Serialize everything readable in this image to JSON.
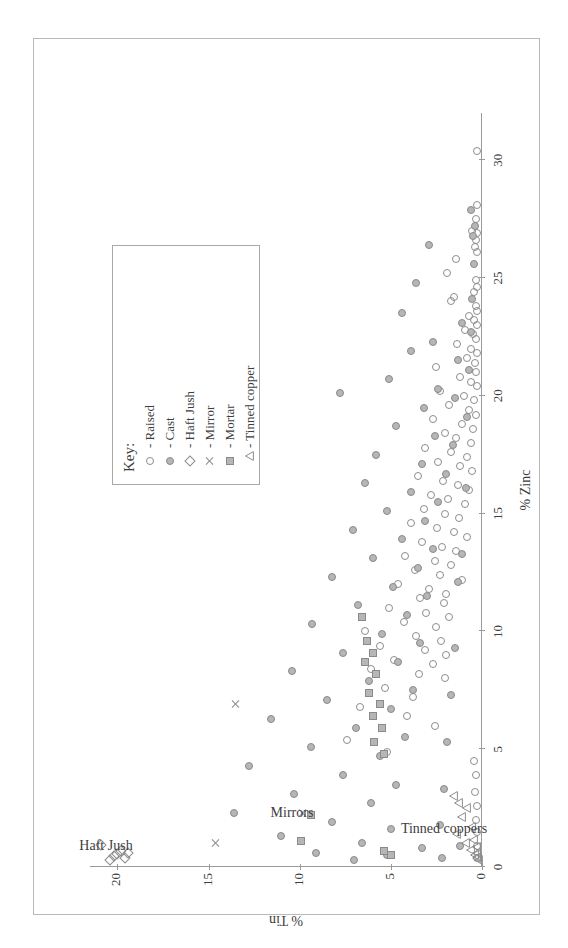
{
  "chart_data": {
    "type": "scatter",
    "title": "",
    "xlabel": "% Zinc",
    "ylabel": "% Tin",
    "xlim": [
      0,
      32
    ],
    "ylim": [
      0,
      21.5
    ],
    "xticks": [
      0,
      5,
      10,
      15,
      20,
      25,
      30
    ],
    "yticks": [
      0,
      5,
      10,
      15,
      20
    ],
    "xtick_labels": [
      "0",
      "5",
      "10",
      "15",
      "20",
      "25",
      "30"
    ],
    "ytick_labels": [
      "0",
      "5",
      "10",
      "15",
      "20"
    ],
    "grid": false,
    "legend_position": "top-right",
    "orientation": "rotated-90-ccw",
    "annotations": [
      {
        "text": "Haft Jush",
        "x": 0.9,
        "y": 20.6
      },
      {
        "text": "Mirrors",
        "x": 2.3,
        "y": 10.4
      },
      {
        "text": "Tinned coppers",
        "x": 1.6,
        "y": 2.1
      }
    ],
    "series": [
      {
        "name": "Raised",
        "marker": "open-circle",
        "color": "#8d8d8d",
        "fill": "none",
        "points": [
          [
            30.4,
            0.3
          ],
          [
            28.1,
            0.25
          ],
          [
            27.5,
            0.35
          ],
          [
            27.0,
            0.55
          ],
          [
            26.9,
            0.3
          ],
          [
            26.6,
            0.35
          ],
          [
            26.3,
            0.4
          ],
          [
            26.1,
            0.3
          ],
          [
            25.8,
            1.4
          ],
          [
            25.2,
            1.9
          ],
          [
            24.9,
            0.35
          ],
          [
            24.6,
            0.3
          ],
          [
            24.4,
            0.45
          ],
          [
            24.2,
            1.55
          ],
          [
            24.0,
            1.7
          ],
          [
            23.8,
            0.35
          ],
          [
            23.6,
            0.3
          ],
          [
            23.4,
            0.7
          ],
          [
            23.2,
            0.45
          ],
          [
            23.0,
            0.3
          ],
          [
            22.8,
            0.95
          ],
          [
            22.6,
            0.5
          ],
          [
            22.4,
            0.35
          ],
          [
            22.2,
            1.35
          ],
          [
            22.0,
            0.6
          ],
          [
            21.8,
            0.3
          ],
          [
            21.6,
            0.85
          ],
          [
            21.4,
            0.4
          ],
          [
            21.2,
            2.5
          ],
          [
            21.0,
            0.35
          ],
          [
            20.8,
            1.2
          ],
          [
            20.6,
            0.6
          ],
          [
            20.4,
            0.3
          ],
          [
            20.2,
            2.3
          ],
          [
            20.0,
            1.0
          ],
          [
            19.8,
            0.45
          ],
          [
            19.6,
            1.8
          ],
          [
            19.4,
            0.7
          ],
          [
            19.2,
            0.35
          ],
          [
            19.0,
            2.7
          ],
          [
            18.8,
            1.1
          ],
          [
            18.6,
            0.5
          ],
          [
            18.4,
            2.05
          ],
          [
            18.2,
            1.45
          ],
          [
            18.0,
            0.6
          ],
          [
            17.8,
            3.1
          ],
          [
            17.6,
            1.7
          ],
          [
            17.4,
            0.8
          ],
          [
            17.2,
            2.4
          ],
          [
            17.0,
            1.2
          ],
          [
            16.8,
            0.55
          ],
          [
            16.6,
            3.5
          ],
          [
            16.4,
            2.15
          ],
          [
            16.2,
            1.3
          ],
          [
            16.0,
            0.7
          ],
          [
            15.8,
            2.8
          ],
          [
            15.6,
            1.85
          ],
          [
            15.4,
            0.95
          ],
          [
            15.2,
            3.2
          ],
          [
            15.0,
            2.05
          ],
          [
            14.8,
            1.25
          ],
          [
            14.6,
            3.9
          ],
          [
            14.4,
            2.45
          ],
          [
            14.2,
            1.55
          ],
          [
            14.0,
            0.85
          ],
          [
            13.8,
            3.3
          ],
          [
            13.6,
            2.2
          ],
          [
            13.4,
            1.4
          ],
          [
            13.2,
            4.2
          ],
          [
            13.0,
            2.6
          ],
          [
            12.8,
            1.7
          ],
          [
            12.6,
            3.7
          ],
          [
            12.4,
            2.3
          ],
          [
            12.2,
            1.1
          ],
          [
            12.0,
            4.6
          ],
          [
            11.8,
            2.9
          ],
          [
            11.6,
            1.95
          ],
          [
            11.4,
            3.4
          ],
          [
            11.2,
            2.1
          ],
          [
            11.0,
            5.1
          ],
          [
            10.8,
            3.05
          ],
          [
            10.6,
            1.8
          ],
          [
            10.4,
            4.3
          ],
          [
            10.2,
            2.55
          ],
          [
            10.0,
            6.4
          ],
          [
            9.8,
            3.6
          ],
          [
            9.6,
            2.25
          ],
          [
            9.4,
            5.6
          ],
          [
            9.2,
            3.15
          ],
          [
            9.0,
            1.95
          ],
          [
            8.8,
            4.8
          ],
          [
            8.6,
            2.7
          ],
          [
            8.4,
            6.1
          ],
          [
            8.2,
            3.45
          ],
          [
            8.0,
            2.05
          ],
          [
            7.6,
            5.3
          ],
          [
            7.2,
            3.8
          ],
          [
            6.8,
            6.7
          ],
          [
            6.4,
            4.1
          ],
          [
            6.0,
            2.6
          ],
          [
            5.4,
            7.4
          ],
          [
            4.9,
            5.2
          ],
          [
            4.5,
            0.45
          ],
          [
            3.9,
            0.35
          ],
          [
            3.2,
            0.4
          ],
          [
            2.6,
            0.3
          ],
          [
            2.0,
            0.35
          ],
          [
            1.5,
            0.3
          ],
          [
            0.9,
            0.3
          ],
          [
            0.4,
            0.25
          ]
        ]
      },
      {
        "name": "Cast",
        "marker": "filled-circle",
        "color": "#b6b6b6",
        "fill": "#b6b6b6",
        "points": [
          [
            27.9,
            0.6
          ],
          [
            27.2,
            0.4
          ],
          [
            26.8,
            0.5
          ],
          [
            26.4,
            2.9
          ],
          [
            25.6,
            0.45
          ],
          [
            24.8,
            3.6
          ],
          [
            24.1,
            0.55
          ],
          [
            23.5,
            4.4
          ],
          [
            23.1,
            1.1
          ],
          [
            22.7,
            0.6
          ],
          [
            22.3,
            2.7
          ],
          [
            21.9,
            3.9
          ],
          [
            21.5,
            1.3
          ],
          [
            21.1,
            0.7
          ],
          [
            20.7,
            5.1
          ],
          [
            20.3,
            2.4
          ],
          [
            19.9,
            1.5
          ],
          [
            19.5,
            3.2
          ],
          [
            19.1,
            0.8
          ],
          [
            18.7,
            4.7
          ],
          [
            18.3,
            2.6
          ],
          [
            17.9,
            1.6
          ],
          [
            17.5,
            5.8
          ],
          [
            17.1,
            3.3
          ],
          [
            16.7,
            2.0
          ],
          [
            16.3,
            6.4
          ],
          [
            15.9,
            3.9
          ],
          [
            15.5,
            2.4
          ],
          [
            15.1,
            5.2
          ],
          [
            14.7,
            3.1
          ],
          [
            14.3,
            7.1
          ],
          [
            13.9,
            4.4
          ],
          [
            13.5,
            2.7
          ],
          [
            13.1,
            6.0
          ],
          [
            12.7,
            3.5
          ],
          [
            12.3,
            8.2
          ],
          [
            11.9,
            4.9
          ],
          [
            11.5,
            3.0
          ],
          [
            11.1,
            6.8
          ],
          [
            10.7,
            4.1
          ],
          [
            10.3,
            9.3
          ],
          [
            9.9,
            5.5
          ],
          [
            9.5,
            3.4
          ],
          [
            9.1,
            7.6
          ],
          [
            8.7,
            4.6
          ],
          [
            8.3,
            10.4
          ],
          [
            7.9,
            6.2
          ],
          [
            7.5,
            3.8
          ],
          [
            7.1,
            8.5
          ],
          [
            6.7,
            5.0
          ],
          [
            6.3,
            11.6
          ],
          [
            5.9,
            6.9
          ],
          [
            5.5,
            4.2
          ],
          [
            5.1,
            9.4
          ],
          [
            4.7,
            5.6
          ],
          [
            4.3,
            12.8
          ],
          [
            3.9,
            7.6
          ],
          [
            3.5,
            4.7
          ],
          [
            3.1,
            10.3
          ],
          [
            2.7,
            6.1
          ],
          [
            2.3,
            13.6
          ],
          [
            1.9,
            8.2
          ],
          [
            1.6,
            5.0
          ],
          [
            1.3,
            11.0
          ],
          [
            1.0,
            6.6
          ],
          [
            0.8,
            3.3
          ],
          [
            0.6,
            9.1
          ],
          [
            0.5,
            5.2
          ],
          [
            0.4,
            2.2
          ],
          [
            0.3,
            7.0
          ],
          [
            20.1,
            7.8
          ],
          [
            16.1,
            0.9
          ],
          [
            13.3,
            1.1
          ],
          [
            12.1,
            1.3
          ],
          [
            9.3,
            1.5
          ],
          [
            7.3,
            1.7
          ],
          [
            5.3,
            1.9
          ],
          [
            3.3,
            2.1
          ],
          [
            1.8,
            2.3
          ],
          [
            0.9,
            1.2
          ]
        ]
      },
      {
        "name": "Haft Jush",
        "marker": "open-diamond",
        "color": "#8d8d8d",
        "fill": "none",
        "points": [
          [
            0.3,
            20.4
          ],
          [
            0.45,
            20.2
          ],
          [
            0.55,
            20.0
          ],
          [
            0.7,
            19.8
          ],
          [
            0.4,
            19.6
          ],
          [
            0.6,
            19.4
          ],
          [
            0.95,
            20.9
          ]
        ]
      },
      {
        "name": "Mirror",
        "marker": "cross",
        "color": "#8d8d8d",
        "fill": "none",
        "points": [
          [
            6.9,
            13.5
          ],
          [
            2.3,
            9.8
          ],
          [
            1.0,
            14.6
          ]
        ]
      },
      {
        "name": "Mortar",
        "marker": "filled-square",
        "color": "#b6b6b6",
        "fill": "#b6b6b6",
        "points": [
          [
            9.6,
            6.3
          ],
          [
            9.1,
            6.0
          ],
          [
            8.7,
            6.4
          ],
          [
            8.2,
            5.8
          ],
          [
            7.4,
            6.2
          ],
          [
            6.9,
            5.6
          ],
          [
            6.4,
            6.0
          ],
          [
            5.9,
            5.5
          ],
          [
            5.3,
            5.9
          ],
          [
            4.8,
            5.4
          ],
          [
            2.2,
            9.4
          ],
          [
            1.1,
            9.9
          ],
          [
            0.7,
            5.4
          ],
          [
            0.5,
            5.0
          ],
          [
            10.6,
            6.6
          ]
        ]
      },
      {
        "name": "Tinned copper",
        "marker": "open-triangle",
        "color": "#8d8d8d",
        "fill": "none",
        "points": [
          [
            2.3,
            0.85
          ],
          [
            1.9,
            1.1
          ],
          [
            1.5,
            0.55
          ],
          [
            1.2,
            1.35
          ],
          [
            0.95,
            0.45
          ],
          [
            0.8,
            0.9
          ],
          [
            0.65,
            0.3
          ],
          [
            0.5,
            0.6
          ],
          [
            0.4,
            0.25
          ],
          [
            0.3,
            0.4
          ],
          [
            0.22,
            0.2
          ],
          [
            0.15,
            0.3
          ],
          [
            0.1,
            0.15
          ],
          [
            2.8,
            1.55
          ],
          [
            2.5,
            1.25
          ]
        ]
      }
    ]
  },
  "legend": {
    "title": "Key:",
    "items": [
      {
        "label": "- Raised",
        "marker": "open-circle"
      },
      {
        "label": "- Cast",
        "marker": "filled-circle"
      },
      {
        "label": "- Haft Jush",
        "marker": "open-diamond"
      },
      {
        "label": "- Mirror",
        "marker": "cross"
      },
      {
        "label": "- Mortar",
        "marker": "filled-square"
      },
      {
        "label": "- Tinned copper",
        "marker": "open-triangle"
      }
    ]
  },
  "colors": {
    "marker_outline": "#8d8d8d",
    "marker_fill": "#b6b6b6",
    "axis": "#9a9a9a",
    "frame": "#b9b9b9",
    "text": "#3d3d3d"
  }
}
